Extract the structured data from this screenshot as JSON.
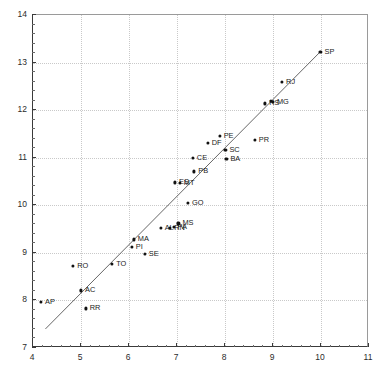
{
  "chart_data": {
    "type": "scatter",
    "title": "",
    "xlabel": "",
    "ylabel": "",
    "xlim": [
      4,
      11
    ],
    "ylim": [
      7,
      14
    ],
    "xticks": [
      4,
      5,
      6,
      7,
      8,
      9,
      10,
      11
    ],
    "yticks": [
      7,
      8,
      9,
      10,
      11,
      12,
      13,
      14
    ],
    "xticklabels": [
      "4",
      "5",
      "6",
      "7",
      "8",
      "9",
      "10",
      "11"
    ],
    "yticklabels": [
      "7",
      "8",
      "9",
      "10",
      "11",
      "12",
      "13",
      "14"
    ],
    "grid": true,
    "grid_style": "dotted",
    "grid_color": "#c9c9c9",
    "legend": "none",
    "marker_color": "#111111",
    "line_color": "#555555",
    "points": [
      {
        "label": "AP",
        "x": 4.19,
        "y": 7.95
      },
      {
        "label": "RO",
        "x": 4.86,
        "y": 8.71
      },
      {
        "label": "AC",
        "x": 5.02,
        "y": 8.19
      },
      {
        "label": "RR",
        "x": 5.12,
        "y": 7.81
      },
      {
        "label": "TO",
        "x": 5.67,
        "y": 8.75
      },
      {
        "label": "PI",
        "x": 6.08,
        "y": 9.11
      },
      {
        "label": "MA",
        "x": 6.12,
        "y": 9.26
      },
      {
        "label": "SE",
        "x": 6.35,
        "y": 8.96
      },
      {
        "label": "AL",
        "x": 6.68,
        "y": 9.5
      },
      {
        "label": "RN",
        "x": 6.88,
        "y": 9.51
      },
      {
        "label": "PA",
        "x": 6.95,
        "y": 9.52
      },
      {
        "label": "MS",
        "x": 7.05,
        "y": 9.6
      },
      {
        "label": "ES",
        "x": 6.98,
        "y": 10.46
      },
      {
        "label": "MT",
        "x": 7.08,
        "y": 10.45
      },
      {
        "label": "PB",
        "x": 7.38,
        "y": 10.69
      },
      {
        "label": "GO",
        "x": 7.25,
        "y": 10.03
      },
      {
        "label": "CE",
        "x": 7.35,
        "y": 10.97
      },
      {
        "label": "DF",
        "x": 7.66,
        "y": 11.29
      },
      {
        "label": "PE",
        "x": 7.91,
        "y": 11.44
      },
      {
        "label": "SC",
        "x": 8.03,
        "y": 11.14
      },
      {
        "label": "BA",
        "x": 8.05,
        "y": 10.95
      },
      {
        "label": "PR",
        "x": 8.64,
        "y": 11.36
      },
      {
        "label": "RS",
        "x": 8.86,
        "y": 12.12
      },
      {
        "label": "MG",
        "x": 9.02,
        "y": 12.15
      },
      {
        "label": "SC2",
        "x": 8.97,
        "y": 12.17
      },
      {
        "label": "RJ",
        "x": 9.21,
        "y": 12.57
      },
      {
        "label": "SP",
        "x": 10.01,
        "y": 13.21
      }
    ],
    "fit_line": {
      "x1": 4.28,
      "y1": 7.38,
      "x2": 10.01,
      "y2": 13.21
    }
  }
}
